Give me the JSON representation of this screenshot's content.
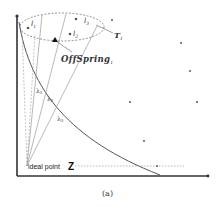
{
  "figure": {
    "caption": "(a)",
    "labels": {
      "l1": "l",
      "l1_sub": "1",
      "l2": "l",
      "l2_sub": "2",
      "l3": "l",
      "l3_sub": "3",
      "T": "T",
      "T_sub": "1",
      "offspring": "OffSpring",
      "offspring_sub": "1",
      "lambda1": "λ",
      "lambda1_sub": "1",
      "lambda2": "λ",
      "lambda2_sub": "2",
      "lambda3": "λ",
      "lambda3_sub": "3",
      "ideal_point": "ideal point",
      "Z": "Z"
    },
    "neighborhood_points": [
      {
        "name": "l1",
        "x": 28,
        "y": 28
      },
      {
        "name": "l2",
        "x": 70,
        "y": 34
      },
      {
        "name": "l3",
        "x": 76,
        "y": 19
      }
    ],
    "offspring_point": {
      "x": 55,
      "y": 40
    },
    "scatter_points": [
      {
        "x": 112,
        "y": 20
      },
      {
        "x": 181,
        "y": 43
      },
      {
        "x": 190,
        "y": 71
      },
      {
        "x": 130,
        "y": 102
      },
      {
        "x": 197,
        "y": 102
      },
      {
        "x": 144,
        "y": 141
      },
      {
        "x": 157,
        "y": 166
      }
    ],
    "colors": {
      "axis": "#333333",
      "curve": "#555555",
      "lines": "#999999",
      "points": "#555555",
      "text": "#222222"
    }
  }
}
